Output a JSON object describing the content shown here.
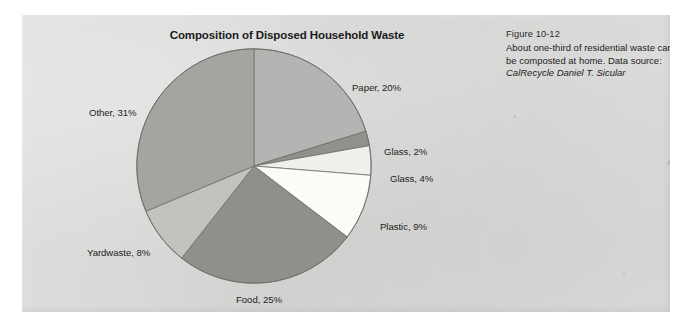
{
  "figure": {
    "title": "Composition of Disposed Household Waste",
    "caption_number": "Figure 10-12",
    "caption_text": "About one-third of residential waste can be composted at home. Data source: ",
    "caption_source": "CalRecycle Daniel T. Sicular",
    "panel_color": "#d8d9d7"
  },
  "chart_data": {
    "type": "pie",
    "title": "Composition of Disposed Household Waste",
    "xlabel": "",
    "ylabel": "",
    "legend_position": "none",
    "grid": false,
    "start_angle_deg": 0,
    "direction": "clockwise",
    "categories": [
      "Paper",
      "Glass",
      "Glass",
      "Plastic",
      "Food",
      "Yardwaste",
      "Other"
    ],
    "values": [
      20,
      2,
      4,
      9,
      25,
      8,
      31
    ],
    "labels": [
      "Paper, 20%",
      "Glass, 2%",
      "Glass, 4%",
      "Plastic, 9%",
      "Food, 25%",
      "Yardwaste, 8%",
      "Other, 31%"
    ],
    "colors": [
      "#b4b5b2",
      "#8f918d",
      "#eff0ec",
      "#fbfbf8",
      "#8e908c",
      "#c2c3bf",
      "#a3a5a1"
    ]
  },
  "slice_labels": {
    "paper": "Paper, 20%",
    "glass_2": "Glass, 2%",
    "glass_4": "Glass, 4%",
    "plastic": "Plastic, 9%",
    "food": "Food, 25%",
    "yardwaste": "Yardwaste, 8%",
    "other": "Other, 31%"
  }
}
